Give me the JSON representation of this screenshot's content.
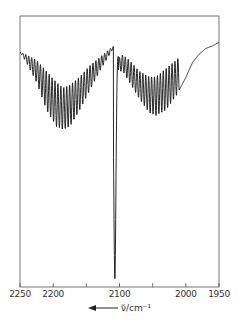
{
  "chart_data": {
    "type": "line",
    "title": "",
    "xlabel": "ν̃/cm⁻¹",
    "xlabel_parts": {
      "symbol": "ν̃",
      "unit": "/cm",
      "exp": "-1"
    },
    "ylabel": "",
    "x_direction": "decreasing",
    "xlim": [
      2250,
      1950
    ],
    "x_ticks": [
      2250,
      2200,
      2150,
      2100,
      2050,
      2000,
      1950
    ],
    "x_tick_labels": [
      "2250",
      "2200",
      "",
      "2100",
      "",
      "2000",
      "1950"
    ],
    "grid": false,
    "legend": null,
    "q_branch": {
      "x": 2107,
      "depth": 0.95
    },
    "envelope_left": {
      "x": [
        2250,
        2240,
        2225,
        2210,
        2195,
        2185,
        2175,
        2160,
        2145,
        2130,
        2115,
        2110
      ],
      "top": [
        0.87,
        0.86,
        0.84,
        0.8,
        0.76,
        0.74,
        0.75,
        0.78,
        0.82,
        0.85,
        0.88,
        0.89
      ],
      "bottom": [
        0.87,
        0.83,
        0.76,
        0.66,
        0.6,
        0.59,
        0.6,
        0.66,
        0.73,
        0.8,
        0.86,
        0.88
      ]
    },
    "envelope_right": {
      "x": [
        2100,
        2095,
        2085,
        2070,
        2055,
        2045,
        2030,
        2015,
        2000,
        1990,
        1980,
        1970,
        1960,
        1950
      ],
      "top": [
        0.85,
        0.86,
        0.84,
        0.8,
        0.78,
        0.78,
        0.81,
        0.84,
        0.87,
        0.89,
        0.9,
        0.91,
        0.91,
        0.91
      ],
      "bottom": [
        0.8,
        0.8,
        0.76,
        0.7,
        0.65,
        0.64,
        0.66,
        0.71,
        0.77,
        0.82,
        0.85,
        0.87,
        0.88,
        0.9
      ]
    },
    "line_spacing_cm": 4.4
  },
  "axis": {
    "arrow_label": "←"
  }
}
